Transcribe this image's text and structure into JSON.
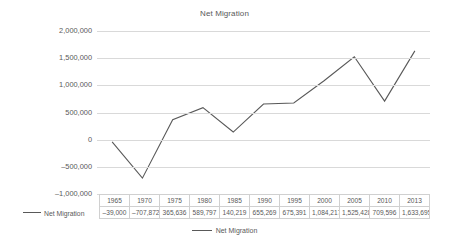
{
  "chart_data": {
    "type": "line",
    "title": "Net Migration",
    "xlabel": "",
    "ylabel": "",
    "categories": [
      "1965",
      "1970",
      "1975",
      "1980",
      "1985",
      "1990",
      "1995",
      "2000",
      "2005",
      "2010",
      "2013"
    ],
    "series": [
      {
        "name": "Net Migration",
        "values": [
          -39000,
          -707872,
          365636,
          589797,
          140219,
          655269,
          675391,
          1084217,
          1525428,
          709596,
          1633695
        ],
        "value_labels": [
          "–39,000",
          "–707,872",
          "365,636",
          "589,797",
          "140,219",
          "655,269",
          "675,391",
          "1,084,217",
          "1,525,428",
          "709,596",
          "1,633,695"
        ],
        "color": "#595959"
      }
    ],
    "ylim": [
      -1000000,
      2000000
    ],
    "yticks": [
      2000000,
      1500000,
      1000000,
      500000,
      0,
      -500000,
      -1000000
    ],
    "ytick_labels": [
      "2,000,000",
      "1,500,000",
      "1,000,000",
      "500,000",
      "0",
      "–500,000",
      "–1,000,000"
    ],
    "grid": true,
    "legend_position": "bottom",
    "has_data_table": true
  },
  "legend": {
    "entries": [
      {
        "label": "Net Migration",
        "color": "#595959"
      }
    ]
  },
  "table": {
    "row_label": "Net Migration"
  },
  "colors": {
    "line": "#595959",
    "gridline": "#d9d9d9",
    "text": "#595959",
    "table_border": "#d0d0d0",
    "background": "#ffffff"
  }
}
